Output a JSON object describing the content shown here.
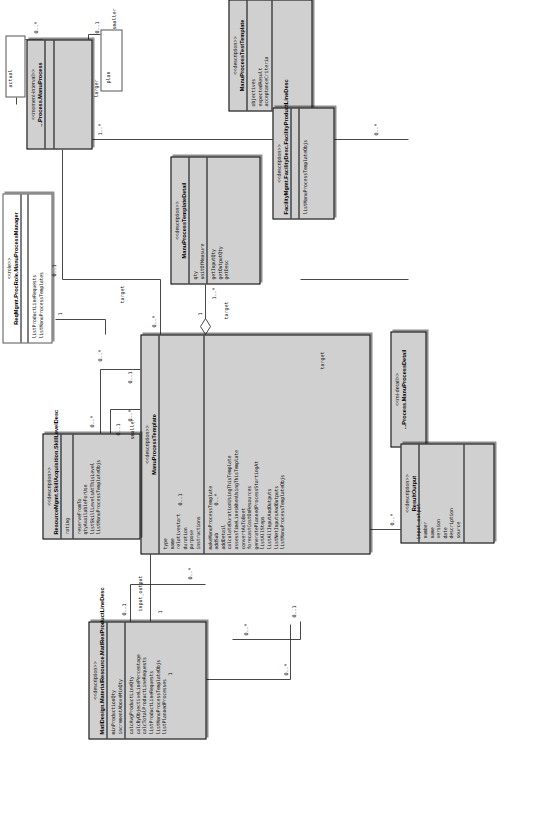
{
  "diagram": {
    "kind": "uml-class-diagram",
    "orientation": "rotated-90-ccw",
    "background": "#ffffff",
    "class_fill": "#d0d0d0",
    "line_color": "#333333"
  },
  "classes": [
    {
      "id": "manuProcess",
      "stereotype": "<<moment-interval>>",
      "name": "...Process.ManuProcess",
      "attributes": [],
      "operations": []
    },
    {
      "id": "manuProcessDetail",
      "stereotype": "<<mi-detail>>",
      "name": "...Process.ManuProcessDetail",
      "attributes": [],
      "operations": []
    },
    {
      "id": "manuProcessManager",
      "stereotype": "<<role>>",
      "name": "ReqMgmt.ProcRole.ManuProcessManager",
      "attributes": [],
      "operations": [
        "listProductLineRequests",
        "listManuProcessTemplates"
      ]
    },
    {
      "id": "manuProcessTemplate",
      "stereotype": "<<description>>",
      "name": "ManuProcessTemplate",
      "attributes": [
        "type",
        "name",
        "relativestart",
        "duration",
        "purpose",
        "instructions"
      ],
      "operations": [
        "makeManuProcessTemplate",
        "addSub",
        "addDetail",
        "calculateDurationUsingThisTemplate",
        "assessTimeLinesWhenUsingThisTemplate",
        "convertAsToBoet",
        "forecastCostOnResources",
        "generatePlannedProcessStartingAt",
        "listAllSteps",
        "listAllInputAndOutputs",
        "listNetInputsAndOutputs",
        "listManuProcessTemplateObjs"
      ]
    },
    {
      "id": "manuProcessTemplateDetail",
      "stereotype": "<<description>>",
      "name": "ManuProcessTemplateDetail",
      "attributes": [
        "qty",
        "unitOfMeasure"
      ],
      "operations": [
        "getInputQty",
        "getOutputQty",
        "getDesc"
      ]
    },
    {
      "id": "manuProcessTestTemplate",
      "stereotype": "<<description>>",
      "name": "ManuProcessTestTemplate",
      "attributes": [
        "objectives",
        "expectedResult",
        "acceptanceCriteria"
      ],
      "operations": []
    },
    {
      "id": "facilityMgmtFacilityProductLineDesc",
      "stereotype": "<<description>>",
      "name": "FacilityMgmt.FacilityDesc.FacilityProductLineDesc",
      "attributes": [],
      "operations": [
        "listManuProcessTemplateObjs"
      ]
    },
    {
      "id": "skillLevelDesc",
      "stereotype": "<<description>>",
      "name": "ResourceMgmt.SkillAcquisition.SkillLevelDesc",
      "attributes": [
        "rating"
      ],
      "operations": [
        "reserveFromTo",
        "qtyAvailableForUse",
        "listSkillLevelsAtThisLevel",
        "listManuProcessTemplateObjs"
      ]
    },
    {
      "id": "matlResProductLineDesc",
      "stereotype": "<<description>>",
      "name": "MatlDesign.MaterialResource.MatlResProductLineDesc",
      "attributes": [
        "minProductionQty",
        "incrementAboveMinQty"
      ],
      "operations": [
        "calcAvgProductLineQty",
        "calcByObjectiveLinePercentage",
        "calcTotalProductLineRequests",
        "listProductLineRequests",
        "listManuProcessTemplateObjs",
        "listPlannedProcesses"
      ]
    },
    {
      "id": "resultOutput",
      "stereotype": "<<description>>",
      "name": "ResultOutput",
      "attributes": [
        "number",
        "name",
        "version",
        "date",
        "description",
        "source"
      ],
      "operations": []
    }
  ],
  "multiplicities": {
    "m_actual": "0..*",
    "m_plan": "0..1",
    "m_smaller": "0..*",
    "m_larger": "0..1",
    "m_detail_one": "1..*",
    "m_detail_star": "0..*",
    "m_mgr_one": "1",
    "m_mgr_star": "0..*",
    "m_tpl_one": "0..1",
    "m_tpl_star": "0..*",
    "m_tpl_detail_one": "1",
    "m_tpl_detail_star": "1..*",
    "m_test_star": "0..*",
    "m_test_one": "0..1",
    "m_skill_star": "0..*",
    "m_skill_one": "0..1",
    "m_matl_one": "0..1",
    "m_matl_star": "0..*",
    "m_fac_one": "0..1",
    "m_fac_star": "0..*",
    "m_result_star": "0..*",
    "m_result_one": "0..1",
    "m_proc_one": "1",
    "m_proc_star": "0..*",
    "m_mpd_star": "0..*",
    "m_mpd_one": "1"
  },
  "role_labels": {
    "actual": "actual",
    "plan": "plan",
    "smaller": "smaller",
    "larger": "larger",
    "target": "target",
    "target2": "target",
    "smaller2": "smaller",
    "input_output": "input_output",
    "input_output2": "input_output",
    "target3": "target"
  }
}
